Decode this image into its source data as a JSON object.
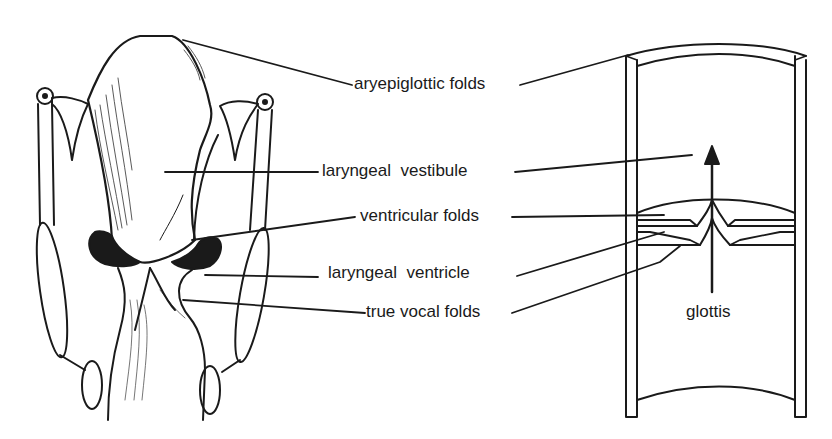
{
  "diagram": {
    "left_figure": "posterior view of larynx (anatomical drawing)",
    "right_figure": "schematic sectional view of laryngeal tube",
    "colors": {
      "ink": "#1a1a1a",
      "background": "#ffffff"
    }
  },
  "labels": {
    "aryepiglottic_folds": "aryepiglottic folds",
    "laryngeal_vestibule": "laryngeal  vestibule",
    "ventricular_folds": "ventricular folds",
    "laryngeal_ventricle": "laryngeal  ventricle",
    "true_vocal_folds": "true vocal folds",
    "glottis": "glottis"
  }
}
